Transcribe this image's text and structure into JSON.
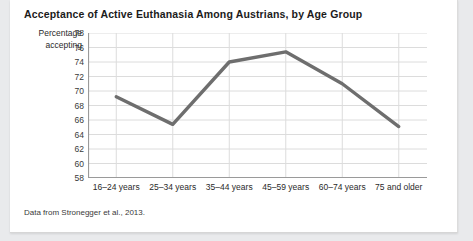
{
  "figure": {
    "title": "Acceptance of Active Euthanasia Among Austrians, by Age Group",
    "source_note": "Data from Stronegger et al., 2013.",
    "yaxis_title_line1": "Percentage",
    "yaxis_title_line2": "accepting"
  },
  "colors": {
    "line": "#6e6e6e",
    "grid": "#dcdcdc",
    "axis": "#9a9a9a",
    "card_background": "#ffffff",
    "page_background": "#e9eaec",
    "title_text": "#1b1b1b",
    "tick_text": "#2a2a2a"
  },
  "chart_data": {
    "type": "line",
    "title": "Acceptance of Active Euthanasia Among Austrians, by Age Group",
    "xlabel": "",
    "ylabel": "Percentage accepting",
    "categories": [
      "16–24 years",
      "25–34 years",
      "35–44 years",
      "45–59 years",
      "60–74 years",
      "75 and older"
    ],
    "values": [
      69.2,
      65.4,
      74.0,
      75.4,
      71.0,
      65.1
    ],
    "ylim": [
      58,
      78
    ],
    "yticks": [
      58,
      60,
      62,
      64,
      66,
      68,
      70,
      72,
      74,
      76,
      78
    ],
    "grid": true,
    "legend": "none",
    "series": [
      {
        "name": "Percentage accepting",
        "values": [
          69.2,
          65.4,
          74.0,
          75.4,
          71.0,
          65.1
        ]
      }
    ]
  }
}
